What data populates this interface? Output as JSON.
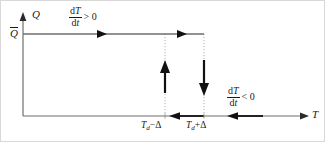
{
  "figure": {
    "type": "phase-diagram",
    "axes": {
      "x_label": "T",
      "y_label": "Q",
      "x_axis_y": 115,
      "y_axis_x": 22,
      "x_axis_end": 308,
      "y_axis_top": 14
    },
    "levels": {
      "q_bar_label": "Q",
      "q_bar_has_overbar": true,
      "q_bar_y": 33,
      "q_bar_line_start_x": 22,
      "q_bar_line_end_x": 203
    },
    "thresholds": [
      {
        "name": "lower-threshold",
        "label_base": "T",
        "label_sub": "d",
        "label_op": "−",
        "label_delta": "Δ",
        "label_full": "T_d − Δ",
        "x": 164
      },
      {
        "name": "upper-threshold",
        "label_base": "T",
        "label_sub": "d",
        "label_op": "+",
        "label_delta": "Δ",
        "label_full": "T_d + Δ",
        "x": 203
      }
    ],
    "annotations": [
      {
        "name": "heating-rate",
        "numerator_d": "d",
        "numerator_var": "T",
        "denominator_d": "d",
        "denominator_var": "t",
        "relation": "> 0",
        "x": 70,
        "y": 8
      },
      {
        "name": "cooling-rate",
        "numerator_d": "d",
        "numerator_var": "T",
        "denominator_d": "d",
        "denominator_var": "t",
        "relation": "< 0",
        "x": 228,
        "y": 88
      }
    ],
    "arrows": {
      "top_rightward": [
        100,
        180
      ],
      "bottom_leftward": [
        178,
        233
      ],
      "vertical_up_x": 164,
      "vertical_down_x": 203
    },
    "colors": {
      "axis": "#6e6e6e",
      "plateau": "#6e6e6e",
      "dotted": "#b0b0b0",
      "arrow": "#111111",
      "text": "#1a1a1a",
      "background": "#ffffff"
    }
  }
}
